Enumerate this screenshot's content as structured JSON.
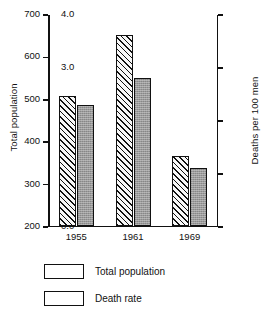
{
  "chart_data": {
    "type": "bar",
    "title": "",
    "subtitle": "",
    "xlabel": "",
    "ylabel": "Total population",
    "y2label": "Deaths per 100 men",
    "categories": [
      "1955",
      "1961",
      "1969"
    ],
    "series": [
      {
        "name": "Total population",
        "axis": "left",
        "pattern": "diagonal-hatch",
        "values": [
          505,
          650,
          363
        ]
      },
      {
        "name": "Death rate",
        "axis": "right",
        "pattern": "gray-stipple",
        "values": [
          2.27,
          2.78,
          1.09
        ]
      }
    ],
    "ylim": [
      200,
      700
    ],
    "y2lim": [
      0.0,
      4.0
    ],
    "yticks": [
      "700",
      "600",
      "500",
      "400",
      "300",
      "200"
    ],
    "ytick_values": [
      700,
      600,
      500,
      400,
      300,
      200
    ],
    "y2ticks": [
      "4.0",
      "3.0",
      "2.0",
      "1.0",
      "0.0"
    ],
    "y2tick_values": [
      4.0,
      3.0,
      2.0,
      1.0,
      0.0
    ],
    "grid": false,
    "legend_position": "bottom-left"
  },
  "legend": {
    "items": [
      {
        "label": "Total population",
        "swatch": "diagonal-hatch"
      },
      {
        "label": "Death rate",
        "swatch": "gray-stipple"
      }
    ]
  },
  "colors": {
    "axis": "#111111",
    "hatch_fill": "#f2f2f2",
    "solid_fill": "#9a9a9a",
    "background": "#ffffff"
  }
}
